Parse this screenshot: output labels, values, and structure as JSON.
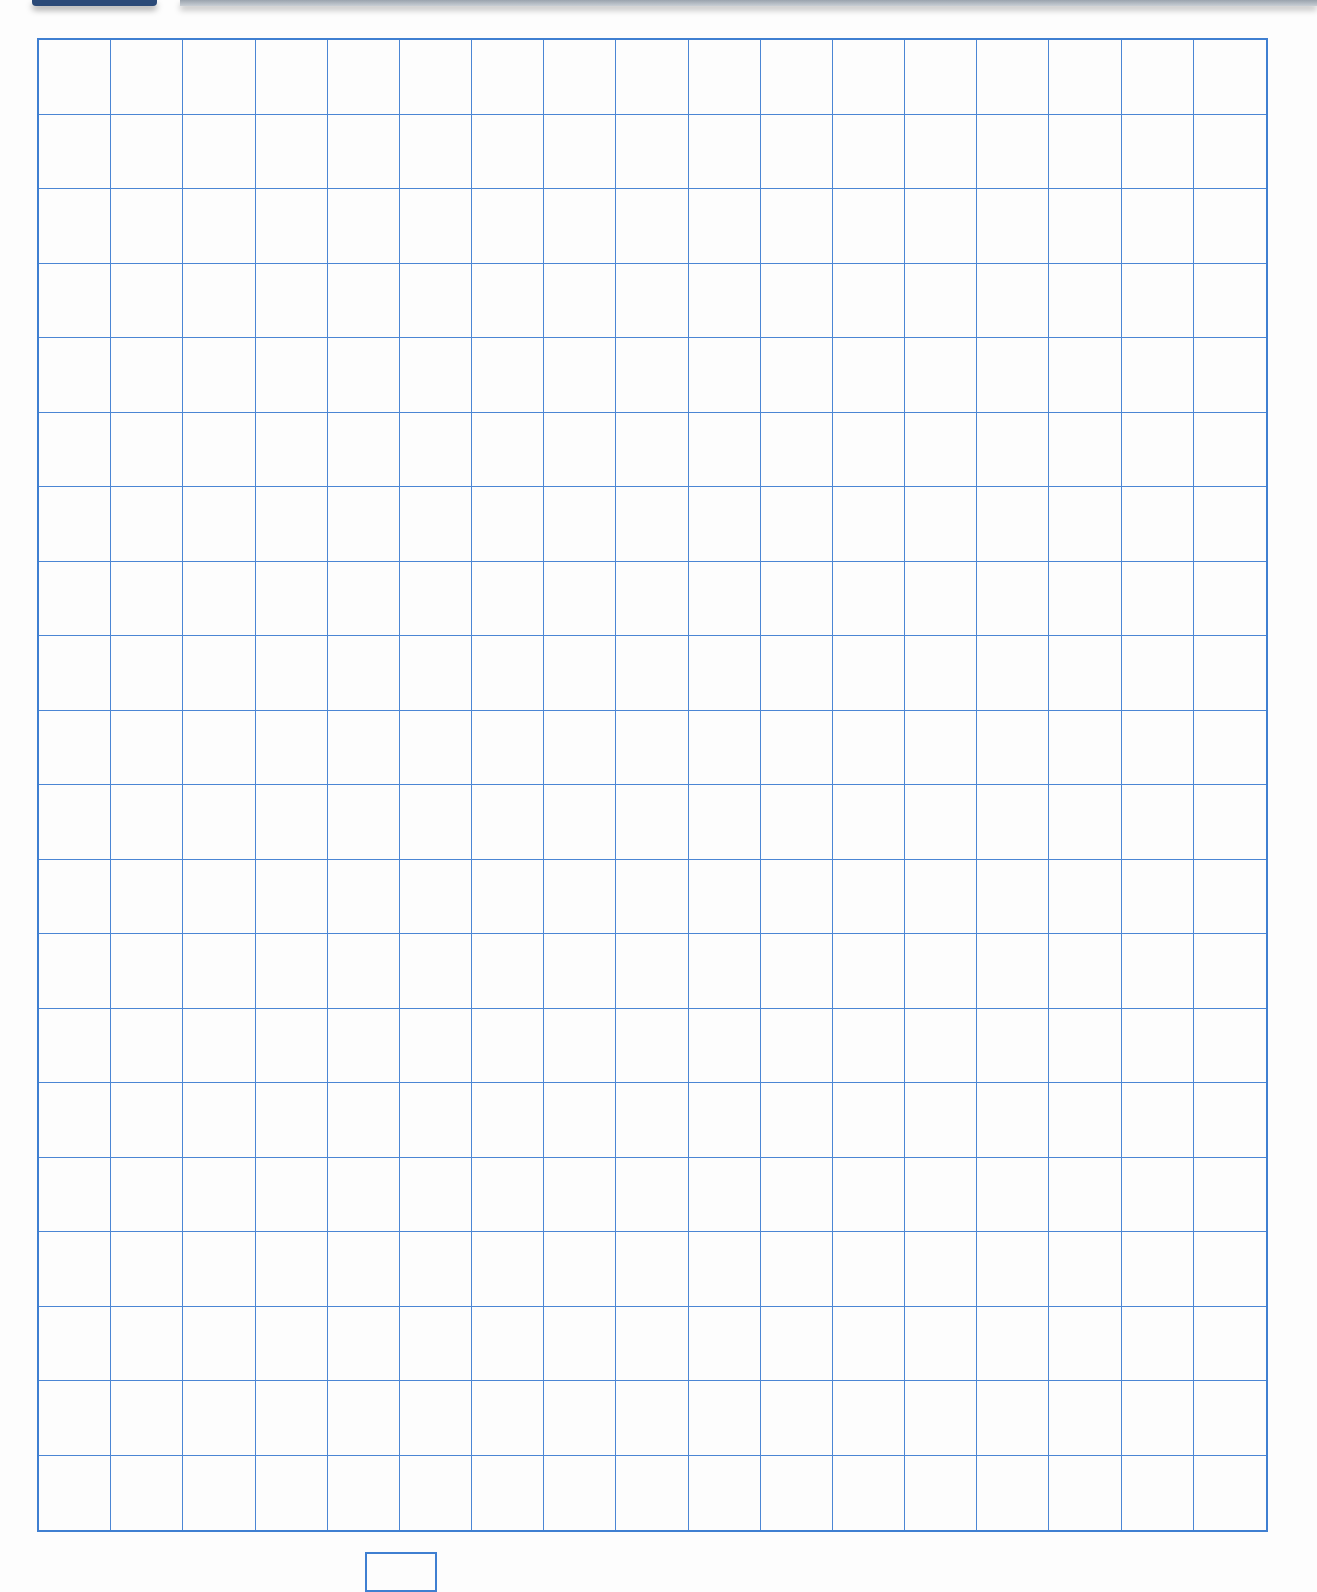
{
  "page": {
    "type": "graph-paper worksheet",
    "grid": {
      "columns": 17,
      "rows": 20,
      "line_color": "#4b86d4",
      "border_color": "#3f7fd1"
    },
    "header_tab_color": "#2b4a78",
    "answer_box": {
      "value": ""
    }
  }
}
